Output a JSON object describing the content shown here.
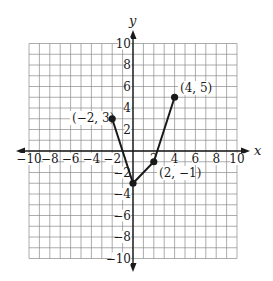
{
  "chart_data": {
    "type": "line",
    "title": "",
    "xlabel": "x",
    "ylabel": "y",
    "xlim": [
      -10,
      10
    ],
    "ylim": [
      -10,
      10
    ],
    "grid": true,
    "x_ticks": [
      -10,
      -8,
      -6,
      -4,
      -2,
      2,
      4,
      6,
      8,
      10
    ],
    "y_ticks": [
      -10,
      -8,
      -6,
      -4,
      -2,
      2,
      4,
      6,
      8,
      10
    ],
    "x_tick_labels": [
      "−10",
      "−8",
      "−6",
      "−4",
      "−2",
      "2",
      "4",
      "6",
      "8",
      "10"
    ],
    "y_tick_labels": [
      "−10",
      "−8",
      "−6",
      "−4",
      "−2",
      "2",
      "4",
      "6",
      "8",
      "10"
    ],
    "series": [
      {
        "name": "piecewise linear graph",
        "points": [
          [
            -2,
            3
          ],
          [
            0,
            -3
          ],
          [
            2,
            -1
          ],
          [
            4,
            5
          ]
        ],
        "x": [
          -2,
          0,
          2,
          4
        ],
        "y": [
          3,
          -3,
          -1,
          5
        ],
        "markers": true
      }
    ],
    "annotations": [
      {
        "text": "(−2, 3)",
        "x": -2,
        "y": 3
      },
      {
        "text": "(4, 5)",
        "x": 4,
        "y": 5
      },
      {
        "text": "(2, −1)",
        "x": 2,
        "y": -1
      }
    ]
  },
  "labels": {
    "x_axis": "x",
    "y_axis": "y",
    "point_a": "(−2, 3)",
    "point_b": "(4, 5)",
    "point_c": "(2, −1)"
  },
  "colors": {
    "line": "#1a1a1a",
    "grid": "#8a8a8a",
    "background": "#ffffff"
  }
}
